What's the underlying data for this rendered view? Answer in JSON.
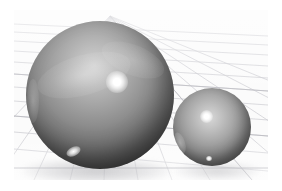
{
  "scene": {
    "title": "Two Spheres on Perspective Grid",
    "renderer_label": "3D raster render",
    "background_color": "#ffffff",
    "canvas_color": "#fbfbfb",
    "viewport": {
      "width": 282,
      "height": 191
    },
    "render_area": {
      "x": 14,
      "y": 10,
      "width": 254,
      "height": 170
    }
  },
  "floor": {
    "name": "perspective-grid-floor",
    "line_color": "#c9c9cf",
    "major_line_color": "#b6b6bd",
    "horizon_line_color": "#aeaeb6",
    "vanishing_point": {
      "x": 96,
      "y": 6
    },
    "grid_visible": true,
    "horizon_y": 158,
    "receding_line_count": 13,
    "horizontal_line_count": 16
  },
  "objects": [
    {
      "name": "sphere-large",
      "label": "Large Sphere",
      "center": {
        "x": 86,
        "y": 85
      },
      "radius": 74,
      "base_color": "#8d8d8d",
      "highlight_color": "#ffffff",
      "shadow_color": "#1c1c1c",
      "material": "glossy gray",
      "specular": {
        "x": 91,
        "y": 61,
        "size": 22
      },
      "secondary_glint": {
        "x": 47,
        "y": 130,
        "size": 15
      }
    },
    {
      "name": "sphere-small",
      "label": "Small Sphere",
      "center": {
        "x": 198,
        "y": 117
      },
      "radius": 39,
      "base_color": "#8a8a8a",
      "highlight_color": "#ffffff",
      "shadow_color": "#2e2e2e",
      "material": "glossy gray",
      "specular": {
        "x": 193,
        "y": 100,
        "size": 13
      },
      "secondary_glint": {
        "x": 196,
        "y": 146,
        "size": 6
      }
    }
  ],
  "shadows": [
    {
      "name": "shadow-large",
      "owner": "sphere-large",
      "color": "#96969b",
      "opacity": 0.5
    },
    {
      "name": "shadow-small",
      "owner": "sphere-small",
      "color": "#9b9ba0",
      "opacity": 0.42
    }
  ]
}
